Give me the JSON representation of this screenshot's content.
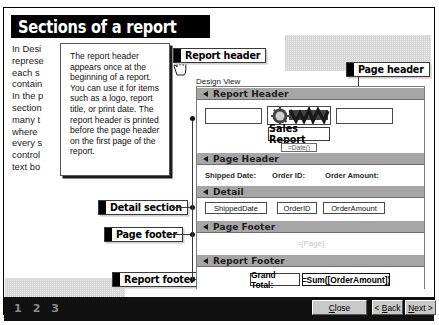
{
  "title": "Sections of a report",
  "body_text": [
    "In Desi",
    "represe",
    "each s",
    "contain",
    "In the p",
    "section",
    "many t",
    "where ",
    "every s",
    "control",
    "text bo"
  ],
  "tooltip": {
    "text": "The report header appears once at the beginning of a report. You can use it for items such as a logo, report title, or print date. The report header is printed before the page header on the first page of the report."
  },
  "callouts": {
    "report_header": "Report header",
    "page_header": "Page header",
    "detail_section": "Detail section",
    "page_footer": "Page footer",
    "report_footer": "Report footer"
  },
  "design_view": {
    "label": "Design View",
    "bands": {
      "report_header": "Report Header",
      "page_header": "Page Header",
      "detail": "Detail",
      "page_footer": "Page Footer",
      "report_footer": "Report Footer"
    },
    "report_header_controls": {
      "logo_alt": "company-logo",
      "title_control": "Sales Report",
      "date_control": "=Date()"
    },
    "page_header_labels": {
      "shipped_date": "Shipped Date:",
      "order_id": "Order ID:",
      "order_amount": "Order Amount:"
    },
    "detail_fields": {
      "shipped_date": "ShippedDate",
      "order_id": "OrderID",
      "order_amount": "OrderAmount"
    },
    "page_footer_control": "=[Page]",
    "report_footer": {
      "grand_total_label": "Grand Total:",
      "grand_total_value": "=Sum([OrderAmount])"
    }
  },
  "footer": {
    "page_numbers": [
      "1",
      "2",
      "3"
    ],
    "close": "Close",
    "back": "< Back",
    "next": "Next >"
  },
  "colors": {
    "banner_bg": "#000000",
    "band_bg": "#a6a6a6",
    "footer_bg": "#111111",
    "button_face": "#c8c8c8"
  }
}
